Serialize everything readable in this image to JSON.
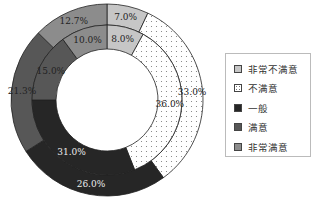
{
  "chart_data": {
    "type": "pie",
    "subtype": "double-donut",
    "title": "",
    "categories": [
      "非常不满意",
      "不满意",
      "一般",
      "满意",
      "非常满意"
    ],
    "series": [
      {
        "name": "outer",
        "values": [
          7.0,
          33.0,
          26.0,
          21.3,
          12.7
        ],
        "labels": [
          "7.0%",
          "33.0%",
          "26.0%",
          "21.3%",
          "12.7%"
        ]
      },
      {
        "name": "inner",
        "values": [
          8.0,
          36.0,
          31.0,
          15.0,
          10.0
        ],
        "labels": [
          "8.0%",
          "36.0%",
          "31.0%",
          "15.0%",
          "10.0%"
        ]
      }
    ],
    "colors": [
      "#c6c6c6",
      "#ffffff",
      "#262626",
      "#575757",
      "#8c8c8c"
    ],
    "legend_position": "right"
  },
  "legend": {
    "items": [
      {
        "label": "非常不满意",
        "color": "#c6c6c6"
      },
      {
        "label": "不满意",
        "color": "#ffffff"
      },
      {
        "label": "一般",
        "color": "#262626"
      },
      {
        "label": "满意",
        "color": "#575757"
      },
      {
        "label": "非常满意",
        "color": "#8c8c8c"
      }
    ]
  }
}
